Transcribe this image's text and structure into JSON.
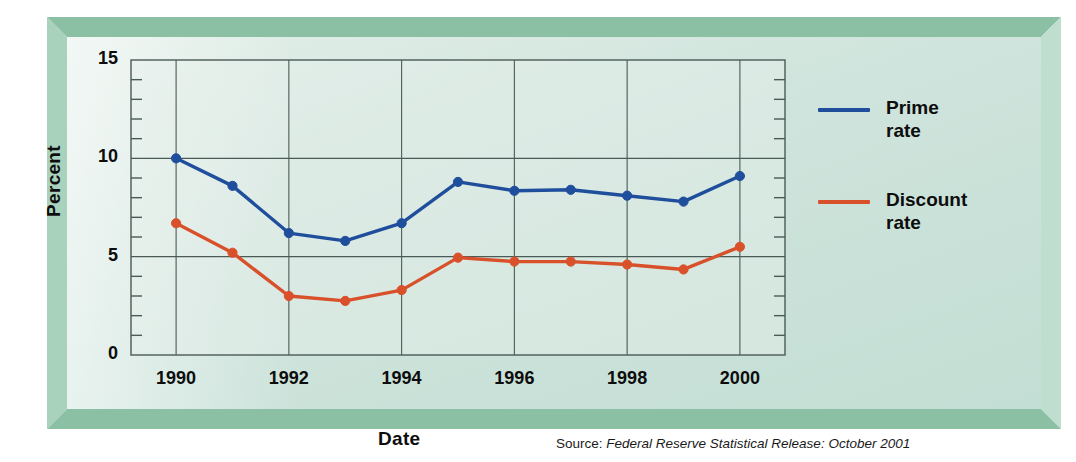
{
  "chart_data": {
    "type": "line",
    "title": "",
    "xlabel": "Date",
    "ylabel": "Percent",
    "x": [
      1990,
      1991,
      1992,
      1993,
      1994,
      1995,
      1996,
      1997,
      1998,
      1999,
      2000
    ],
    "xlim": [
      1989.2,
      2000.8
    ],
    "ylim": [
      0,
      15
    ],
    "yticks": [
      0,
      5,
      10,
      15
    ],
    "ytick_labels": [
      "0",
      "5",
      "10",
      "15"
    ],
    "y_minor_tick_step": 1,
    "xticks": [
      1990,
      1992,
      1994,
      1996,
      1998,
      2000
    ],
    "xtick_labels": [
      "1990",
      "1992",
      "1994",
      "1996",
      "1998",
      "2000"
    ],
    "grid": true,
    "grid_x_at": [
      1990,
      1992,
      1994,
      1996,
      1998,
      2000
    ],
    "grid_y_at": [
      5,
      10
    ],
    "legend_position": "right",
    "series": [
      {
        "name": "Prime rate",
        "color": "#1f4e9c",
        "marker": "circle",
        "values": [
          10.0,
          8.6,
          6.2,
          5.8,
          6.7,
          8.8,
          8.35,
          8.4,
          8.1,
          7.8,
          9.1
        ]
      },
      {
        "name": "Discount rate",
        "color": "#d9512b",
        "marker": "circle",
        "values": [
          6.7,
          5.2,
          3.0,
          2.75,
          3.3,
          4.95,
          4.75,
          4.75,
          4.6,
          4.35,
          5.5
        ]
      }
    ],
    "source_prefix": "Source: ",
    "source_title": "Federal Reserve Statistical Release: October 2001"
  },
  "legend": {
    "items": [
      {
        "label_line1": "Prime",
        "label_line2": "rate",
        "color": "#1f4e9c"
      },
      {
        "label_line1": "Discount",
        "label_line2": "rate",
        "color": "#d9512b"
      }
    ]
  },
  "colors": {
    "prime": "#1f4e9c",
    "discount": "#d9512b",
    "frame": "#8cc0a4",
    "panel": "#cfe4dc",
    "axis": "#4a5a57"
  }
}
